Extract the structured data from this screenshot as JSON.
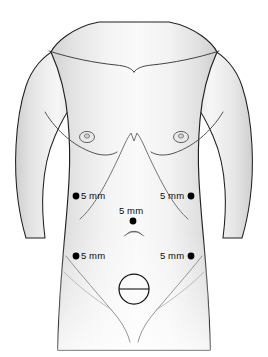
{
  "figure": {
    "background_color": "#ffffff",
    "outline_color": "#231f20",
    "skin_fill_color": "#f2f2f2",
    "shading_color": "#d9d9d9",
    "marker_color": "#000000"
  },
  "body": {
    "regions": [
      {
        "name": "shoulders",
        "label": "shoulders"
      },
      {
        "name": "clavicles",
        "label": "clavicles"
      },
      {
        "name": "sternal-notch",
        "label": "sternal notch"
      },
      {
        "name": "left-arm",
        "label": "left arm"
      },
      {
        "name": "right-arm",
        "label": "right arm"
      },
      {
        "name": "left-nipple",
        "label": "left nipple"
      },
      {
        "name": "right-nipple",
        "label": "right nipple"
      },
      {
        "name": "costal-margin",
        "label": "costal margin"
      },
      {
        "name": "xiphoid",
        "label": "xiphoid process"
      },
      {
        "name": "umbilicus",
        "label": "umbilicus"
      },
      {
        "name": "inguinal-creases",
        "label": "inguinal creases"
      },
      {
        "name": "suprapubic-incision",
        "label": "suprapubic incision"
      }
    ]
  },
  "ports": [
    {
      "id": "upper-left-port",
      "name": "upper-left-5mm-port",
      "size_label": "5 mm",
      "dot_x": 76,
      "dot_y": 196,
      "dot_radius": 3.4,
      "label_x": 81,
      "label_y": 191,
      "label_side": "right"
    },
    {
      "id": "upper-right-port",
      "name": "upper-right-5mm-port",
      "size_label": "5 mm",
      "dot_x": 191,
      "dot_y": 196,
      "dot_radius": 3.4,
      "label_x": 160,
      "label_y": 191,
      "label_side": "left"
    },
    {
      "id": "midline-port",
      "name": "midline-5mm-port",
      "size_label": "5 mm",
      "dot_x": 133,
      "dot_y": 221,
      "dot_radius": 3.4,
      "label_x": 119,
      "label_y": 206,
      "label_side": "above"
    },
    {
      "id": "lower-left-port",
      "name": "lower-left-5mm-port",
      "size_label": "5 mm",
      "dot_x": 76,
      "dot_y": 256,
      "dot_radius": 3.4,
      "label_x": 81,
      "label_y": 251,
      "label_side": "right"
    },
    {
      "id": "lower-right-port",
      "name": "lower-right-5mm-port",
      "size_label": "5 mm",
      "dot_x": 191,
      "dot_y": 256,
      "dot_radius": 3.4,
      "label_x": 160,
      "label_y": 251,
      "label_side": "left"
    }
  ],
  "extraction_site": {
    "name": "suprapubic-extraction-circle",
    "center_x": 134,
    "center_y": 289,
    "radius": 15,
    "has_horizontal_line": true,
    "label": ""
  }
}
